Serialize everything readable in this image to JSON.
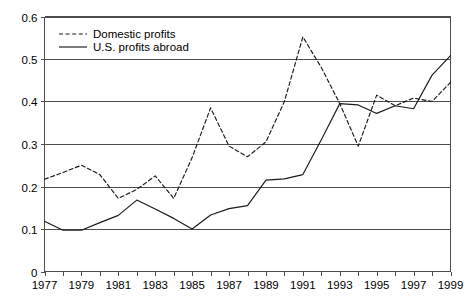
{
  "chart_data": {
    "type": "line",
    "title": "",
    "xlabel": "",
    "ylabel": "",
    "xlim": [
      1977,
      1999
    ],
    "ylim": [
      0,
      0.6
    ],
    "grid": true,
    "legend_position": "top-left",
    "x": [
      1977,
      1978,
      1979,
      1980,
      1981,
      1982,
      1983,
      1984,
      1985,
      1986,
      1987,
      1988,
      1989,
      1990,
      1991,
      1992,
      1993,
      1994,
      1995,
      1996,
      1997,
      1998,
      1999
    ],
    "x_tick_labels": [
      "1977",
      "1979",
      "1981",
      "1983",
      "1985",
      "1987",
      "1989",
      "1991",
      "1993",
      "1995",
      "1997",
      "1999"
    ],
    "x_tick_values": [
      1977,
      1979,
      1981,
      1983,
      1985,
      1987,
      1989,
      1991,
      1993,
      1995,
      1997,
      1999
    ],
    "y_tick_labels": [
      "0",
      "0.1",
      "0.2",
      "0.3",
      "0.4",
      "0.5",
      "0.6"
    ],
    "y_tick_values": [
      0,
      0.1,
      0.2,
      0.3,
      0.4,
      0.5,
      0.6
    ],
    "series": [
      {
        "name": "Domestic profits",
        "style": "dashed",
        "color": "#1a1a1a",
        "values": [
          0.217,
          0.233,
          0.25,
          0.228,
          0.172,
          0.193,
          0.225,
          0.172,
          0.268,
          0.385,
          0.295,
          0.27,
          0.305,
          0.4,
          0.552,
          0.48,
          0.395,
          0.295,
          0.415,
          0.39,
          0.408,
          0.4,
          0.445
        ]
      },
      {
        "name": "U.S. profits abroad",
        "style": "solid",
        "color": "#1a1a1a",
        "values": [
          0.118,
          0.097,
          0.097,
          0.115,
          0.132,
          0.168,
          0.147,
          0.125,
          0.1,
          0.133,
          0.148,
          0.155,
          0.215,
          0.218,
          0.228,
          0.31,
          0.395,
          0.392,
          0.372,
          0.39,
          0.383,
          0.462,
          0.508
        ]
      }
    ]
  },
  "legend": {
    "items": [
      {
        "label": "Domestic profits",
        "style": "dashed"
      },
      {
        "label": "U.S. profits abroad",
        "style": "solid"
      }
    ]
  }
}
